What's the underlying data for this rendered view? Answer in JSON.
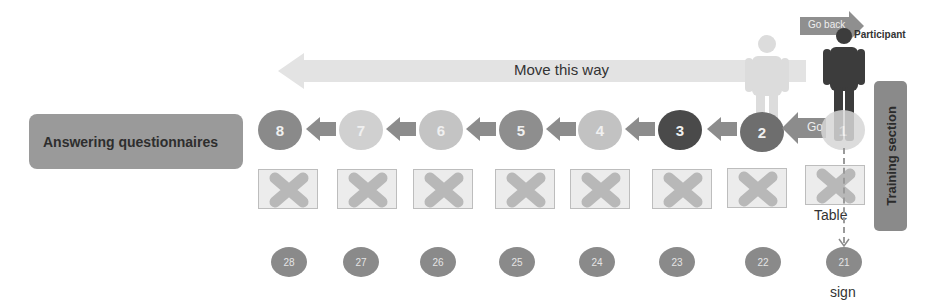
{
  "left_box": {
    "label": "Answering questionnaires",
    "color": "#9a9a9a"
  },
  "right_box": {
    "label": "Training section",
    "color": "#8a8a8a"
  },
  "direction_arrow": {
    "label": "Move this way",
    "color": "#e3e3e3"
  },
  "go_back_arrow": {
    "label": "Go back",
    "color": "#8f8f8f"
  },
  "go_arrow": {
    "label": "Go"
  },
  "participant": {
    "label": "Participant",
    "color": "#3c3c3c"
  },
  "ghost_participant": {
    "color": "#dcdcdc"
  },
  "stations": [
    {
      "number": "8",
      "color": "#8a8a8a"
    },
    {
      "number": "7",
      "color": "#d0d0d0"
    },
    {
      "number": "6",
      "color": "#c4c4c4"
    },
    {
      "number": "5",
      "color": "#8e8e8e"
    },
    {
      "number": "4",
      "color": "#c2c2c2"
    },
    {
      "number": "3",
      "color": "#4a4a4a"
    },
    {
      "number": "2",
      "color": "#6e6e6e"
    },
    {
      "number": "1",
      "color": "#d6d6d6"
    }
  ],
  "tables": {
    "label": "Table",
    "count": 8
  },
  "signs": [
    {
      "number": "28"
    },
    {
      "number": "27"
    },
    {
      "number": "26"
    },
    {
      "number": "25"
    },
    {
      "number": "24"
    },
    {
      "number": "23"
    },
    {
      "number": "22"
    },
    {
      "number": "21"
    }
  ],
  "sign_caption": "sign"
}
